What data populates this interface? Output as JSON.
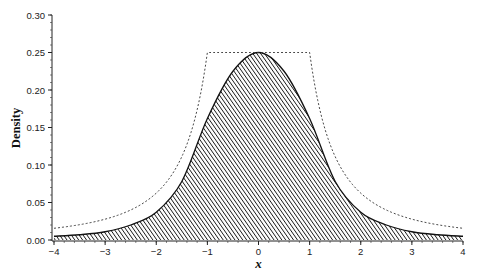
{
  "chart_data": {
    "type": "area",
    "title": "",
    "xlabel": "x",
    "ylabel": "Density",
    "xlim": [
      -4,
      4
    ],
    "ylim": [
      0,
      0.3
    ],
    "x_ticks": [
      "−4",
      "−3",
      "−2",
      "−1",
      "0",
      "1",
      "2",
      "3",
      "4"
    ],
    "x_tick_values": [
      -4,
      -3,
      -2,
      -1,
      0,
      1,
      2,
      3,
      4
    ],
    "y_ticks": [
      "0.00",
      "0.05",
      "0.10",
      "0.15",
      "0.20",
      "0.25",
      "0.30"
    ],
    "y_tick_values": [
      0,
      0.05,
      0.1,
      0.15,
      0.2,
      0.25,
      0.3
    ],
    "grid": false,
    "legend": null,
    "series": [
      {
        "name": "density (hatched area)",
        "style": "solid line, diagonal hatch fill",
        "x": [
          -4,
          -3.5,
          -3,
          -2.5,
          -2,
          -1.5,
          -1,
          -0.5,
          0,
          0.5,
          1,
          1.5,
          2,
          2.5,
          3,
          3.5,
          4
        ],
        "values": [
          0.005,
          0.007,
          0.011,
          0.02,
          0.037,
          0.078,
          0.162,
          0.225,
          0.25,
          0.225,
          0.162,
          0.078,
          0.037,
          0.02,
          0.011,
          0.007,
          0.005
        ]
      },
      {
        "name": "envelope (dashed)",
        "style": "dashed line",
        "x": [
          -4,
          -3.5,
          -3,
          -2.5,
          -2,
          -1.5,
          -1,
          -0.5,
          0,
          0.5,
          1,
          1.5,
          2,
          2.5,
          3,
          3.5,
          4
        ],
        "values": [
          0.0156,
          0.0204,
          0.0278,
          0.04,
          0.0625,
          0.111,
          0.25,
          0.25,
          0.25,
          0.25,
          0.25,
          0.111,
          0.0625,
          0.04,
          0.0278,
          0.0204,
          0.0156
        ]
      }
    ]
  }
}
